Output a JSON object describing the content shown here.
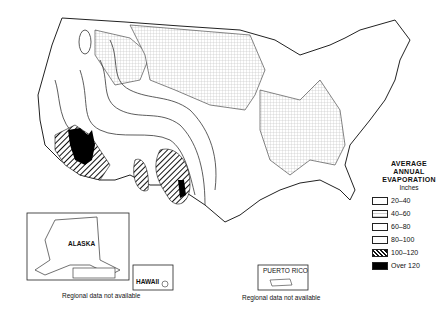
{
  "legend": {
    "title_lines": [
      "AVERAGE",
      "ANNUAL",
      "EVAPORATION"
    ],
    "units": "Inches",
    "items": [
      {
        "label": "20–40",
        "pattern": "blank"
      },
      {
        "label": "40–60",
        "pattern": "fine-grid"
      },
      {
        "label": "60–80",
        "pattern": "blank"
      },
      {
        "label": "80–100",
        "pattern": "blank"
      },
      {
        "label": "100–120",
        "pattern": "diagonal-hatch"
      },
      {
        "label": "Over 120",
        "pattern": "solid-black"
      }
    ]
  },
  "insets": {
    "alaska": {
      "label": "ALASKA"
    },
    "hawaii": {
      "label": "HAWAII"
    },
    "puerto_rico": {
      "label": "PUERTO RICO"
    }
  },
  "notes": {
    "alaska_hawaii": "Regional data not available",
    "puerto_rico": "Regional data not available"
  },
  "contour_labels": [
    "40",
    "50",
    "60",
    "70",
    "80",
    "90",
    "100",
    "110",
    "120",
    "130",
    "140",
    "150"
  ]
}
